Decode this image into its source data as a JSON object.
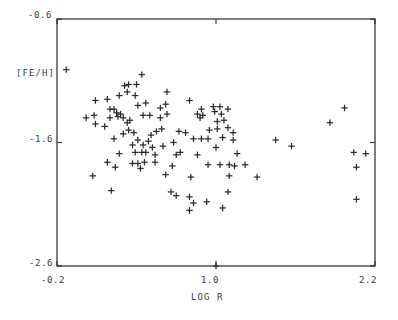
{
  "chart_data": {
    "type": "scatter",
    "title": "",
    "xlabel": "LOG R",
    "ylabel": "[FE/H]",
    "xlim": [
      -0.2,
      2.2
    ],
    "ylim": [
      -2.6,
      -0.6
    ],
    "xticks": [
      -0.2,
      1.0,
      2.2
    ],
    "xticklabels": [
      "-0.2",
      "1.0",
      "2.2"
    ],
    "yticks": [
      -2.6,
      -1.6,
      -0.6
    ],
    "yticklabels": [
      "-2.6",
      "-1.6",
      "-0.6"
    ],
    "grid": false,
    "legend": null,
    "marker": "plus",
    "marker_color": "#2b2b2b",
    "frame": "box",
    "tick_direction": "out",
    "n_points": 121,
    "points": [
      [
        -0.13,
        -1.01
      ],
      [
        0.44,
        -1.05
      ],
      [
        0.31,
        -1.14
      ],
      [
        0.34,
        -1.13
      ],
      [
        0.4,
        -1.13
      ],
      [
        0.33,
        -1.19
      ],
      [
        0.09,
        -1.26
      ],
      [
        0.18,
        -1.25
      ],
      [
        0.27,
        -1.22
      ],
      [
        0.39,
        -1.22
      ],
      [
        0.63,
        -1.19
      ],
      [
        0.2,
        -1.33
      ],
      [
        0.23,
        -1.33
      ],
      [
        0.25,
        -1.36
      ],
      [
        0.58,
        -1.32
      ],
      [
        0.62,
        -1.29
      ],
      [
        0.41,
        -1.3
      ],
      [
        0.47,
        -1.28
      ],
      [
        0.8,
        -1.26
      ],
      [
        0.89,
        -1.33
      ],
      [
        0.98,
        -1.31
      ],
      [
        1.03,
        -1.31
      ],
      [
        0.02,
        -1.4
      ],
      [
        0.08,
        -1.38
      ],
      [
        0.09,
        -1.45
      ],
      [
        0.2,
        -1.4
      ],
      [
        0.26,
        -1.39
      ],
      [
        0.28,
        -1.37
      ],
      [
        0.3,
        -1.4
      ],
      [
        0.35,
        -1.42
      ],
      [
        0.45,
        -1.38
      ],
      [
        0.5,
        -1.38
      ],
      [
        0.58,
        -1.4
      ],
      [
        0.63,
        -1.37
      ],
      [
        0.86,
        -1.37
      ],
      [
        0.88,
        -1.4
      ],
      [
        0.9,
        -1.38
      ],
      [
        0.99,
        -1.35
      ],
      [
        1.04,
        -1.37
      ],
      [
        1.09,
        -1.33
      ],
      [
        1.97,
        -1.32
      ],
      [
        0.16,
        -1.47
      ],
      [
        0.33,
        -1.44
      ],
      [
        1.01,
        -1.43
      ],
      [
        1.06,
        -1.42
      ],
      [
        1.86,
        -1.44
      ],
      [
        0.3,
        -1.53
      ],
      [
        0.34,
        -1.5
      ],
      [
        0.38,
        -1.52
      ],
      [
        0.51,
        -1.54
      ],
      [
        0.55,
        -1.51
      ],
      [
        0.59,
        -1.49
      ],
      [
        0.72,
        -1.51
      ],
      [
        0.77,
        -1.52
      ],
      [
        0.95,
        -1.5
      ],
      [
        1.01,
        -1.49
      ],
      [
        1.09,
        -1.48
      ],
      [
        1.13,
        -1.52
      ],
      [
        0.23,
        -1.57
      ],
      [
        0.41,
        -1.58
      ],
      [
        0.49,
        -1.59
      ],
      [
        0.68,
        -1.6
      ],
      [
        0.83,
        -1.57
      ],
      [
        0.89,
        -1.57
      ],
      [
        0.94,
        -1.57
      ],
      [
        1.05,
        -1.56
      ],
      [
        1.13,
        -1.58
      ],
      [
        1.45,
        -1.58
      ],
      [
        0.37,
        -1.62
      ],
      [
        0.45,
        -1.62
      ],
      [
        0.52,
        -1.64
      ],
      [
        0.6,
        -1.63
      ],
      [
        1.0,
        -1.64
      ],
      [
        1.57,
        -1.63
      ],
      [
        0.27,
        -1.69
      ],
      [
        0.39,
        -1.68
      ],
      [
        0.44,
        -1.68
      ],
      [
        0.47,
        -1.68
      ],
      [
        0.54,
        -1.7
      ],
      [
        0.7,
        -1.7
      ],
      [
        0.73,
        -1.68
      ],
      [
        0.86,
        -1.7
      ],
      [
        1.16,
        -1.69
      ],
      [
        2.04,
        -1.68
      ],
      [
        2.13,
        -1.69
      ],
      [
        0.18,
        -1.76
      ],
      [
        0.37,
        -1.77
      ],
      [
        0.41,
        -1.77
      ],
      [
        0.46,
        -1.76
      ],
      [
        0.54,
        -1.76
      ],
      [
        0.24,
        -1.8
      ],
      [
        0.43,
        -1.81
      ],
      [
        0.67,
        -1.79
      ],
      [
        0.94,
        -1.78
      ],
      [
        1.03,
        -1.78
      ],
      [
        1.1,
        -1.78
      ],
      [
        1.14,
        -1.79
      ],
      [
        1.22,
        -1.78
      ],
      [
        2.06,
        -1.8
      ],
      [
        0.07,
        -1.87
      ],
      [
        0.62,
        -1.86
      ],
      [
        0.81,
        -1.88
      ],
      [
        1.1,
        -1.87
      ],
      [
        1.31,
        -1.88
      ],
      [
        0.21,
        -1.99
      ],
      [
        0.66,
        -2.0
      ],
      [
        0.7,
        -2.03
      ],
      [
        1.09,
        -2.0
      ],
      [
        0.8,
        -2.04
      ],
      [
        0.83,
        -2.09
      ],
      [
        0.93,
        -2.08
      ],
      [
        2.06,
        -2.06
      ],
      [
        0.8,
        -2.15
      ],
      [
        1.05,
        -2.13
      ],
      [
        1.0,
        -2.6
      ]
    ]
  },
  "axes": {
    "y_top_label": "-0.6",
    "y_mid_label": "-1.6",
    "y_bot_label": "-2.6",
    "x_left_label": "-0.2",
    "x_mid_label": "1.0",
    "x_right_label": "2.2",
    "y_title": "[FE/H]",
    "x_title": "LOG R"
  }
}
